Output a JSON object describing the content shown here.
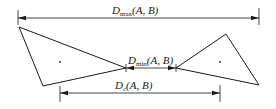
{
  "diagram": {
    "type": "distance-between-polygons",
    "colors": {
      "stroke": "#1a1a1a",
      "background": "#ffffff"
    },
    "labels": {
      "dmax": {
        "symbol": "D",
        "subscript": "max",
        "args": "(A, B)"
      },
      "dmin": {
        "symbol": "D",
        "subscript": "min",
        "args": "(A, B)"
      },
      "dc": {
        "symbol": "D",
        "subscript": "c",
        "args": "(A, B)"
      }
    },
    "shapes": {
      "triangle_a": {
        "points": [
          [
            19,
            27
          ],
          [
            126,
            68
          ],
          [
            43,
            86
          ]
        ],
        "centroid": [
          60,
          62
        ]
      },
      "triangle_b": {
        "points": [
          [
            226,
            34
          ],
          [
            259,
            85
          ],
          [
            176,
            68
          ]
        ],
        "centroid": [
          220,
          62
        ]
      }
    },
    "dimensions": {
      "dmax": {
        "y": 18,
        "x1": 18,
        "x2": 259
      },
      "dmin": {
        "y": 68,
        "x1": 126,
        "x2": 176
      },
      "dc": {
        "y": 93,
        "x1": 60,
        "x2": 220
      }
    }
  }
}
